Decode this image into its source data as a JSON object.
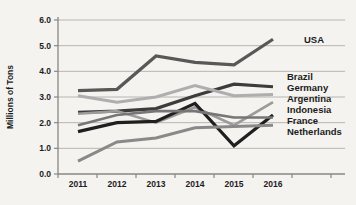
{
  "chart_data": {
    "type": "line",
    "title": "",
    "xlabel": "",
    "ylabel": "Millions of Tons",
    "ylim": [
      0,
      6
    ],
    "ytick_step": 1.0,
    "ytick_labels": [
      "0.0",
      "1.0",
      "2.0",
      "3.0",
      "4.0",
      "5.0",
      "6.0"
    ],
    "categories": [
      "2011",
      "2012",
      "2013",
      "2014",
      "2015",
      "2016"
    ],
    "grid": true,
    "legend_position": "labels-at-line-ends-right",
    "axis_color": "#8a8782",
    "grid_color": "#b8b5b0",
    "series": [
      {
        "name": "USA",
        "values": [
          3.25,
          3.3,
          4.6,
          4.35,
          4.25,
          5.25
        ],
        "color": "#585858",
        "width": 3.2
      },
      {
        "name": "Brazil",
        "values": [
          2.4,
          2.45,
          2.55,
          3.05,
          3.5,
          3.4
        ],
        "color": "#3c3c3c",
        "width": 3.2
      },
      {
        "name": "Germany",
        "values": [
          3.05,
          2.8,
          3.0,
          3.45,
          3.05,
          3.1
        ],
        "color": "#aeaeae",
        "width": 3.0
      },
      {
        "name": "Argentina",
        "values": [
          2.35,
          2.45,
          2.0,
          2.6,
          1.9,
          2.8
        ],
        "color": "#9b9b9b",
        "width": 2.6
      },
      {
        "name": "Indonesia",
        "values": [
          1.65,
          2.0,
          2.05,
          2.75,
          1.1,
          2.3
        ],
        "color": "#1f1f1f",
        "width": 3.2
      },
      {
        "name": "France",
        "values": [
          1.9,
          2.3,
          2.45,
          2.45,
          2.2,
          2.2
        ],
        "color": "#767676",
        "width": 2.6
      },
      {
        "name": "Netherlands",
        "values": [
          0.5,
          1.25,
          1.4,
          1.8,
          1.85,
          1.9
        ],
        "color": "#898989",
        "width": 3.0
      }
    ]
  }
}
